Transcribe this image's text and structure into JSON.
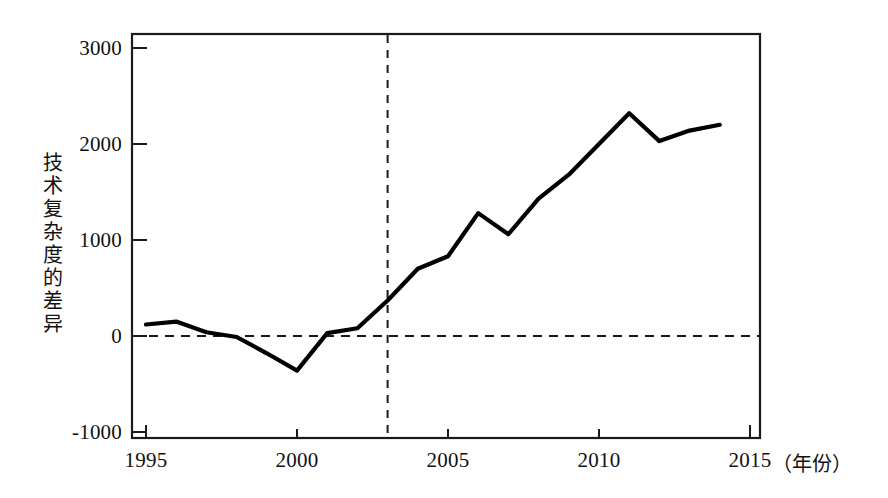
{
  "chart_data": {
    "type": "line",
    "title": "",
    "subtitle": "",
    "xlabel": "年份",
    "ylabel": "技术复杂度的差异",
    "xlim": [
      1995,
      2015
    ],
    "ylim": [
      -1000,
      3000
    ],
    "xticks": [
      "1995",
      "2000",
      "2005",
      "2010",
      "2015"
    ],
    "xtick_values": [
      1995,
      2000,
      2005,
      2010,
      2015
    ],
    "yticks": [
      "3000",
      "2000",
      "1000",
      "0",
      "-1000"
    ],
    "ytick_values": [
      3000,
      2000,
      1000,
      0,
      -1000
    ],
    "grid": false,
    "legend": "none",
    "x": [
      1995,
      1996,
      1997,
      1998,
      1999,
      2000,
      2001,
      2002,
      2003,
      2004,
      2005,
      2006,
      2007,
      2008,
      2009,
      2010,
      2011,
      2012,
      2013,
      2014
    ],
    "series": [
      {
        "name": "技术复杂度的差异",
        "color": "#000000",
        "values": [
          120,
          150,
          40,
          -10,
          -180,
          -360,
          30,
          80,
          370,
          700,
          830,
          1280,
          1060,
          1430,
          1680,
          2000,
          2320,
          2030,
          2140,
          2200
        ]
      }
    ],
    "annotations": [
      {
        "name": "reference-line-vertical",
        "type": "vline",
        "x": 2003,
        "style": "dashed",
        "label": ""
      },
      {
        "name": "reference-line-zero",
        "type": "hline",
        "y": 0,
        "style": "dashed",
        "label": ""
      }
    ]
  },
  "axis": {
    "y_title_chars": [
      "技",
      "术",
      "复",
      "杂",
      "度",
      "的",
      "差",
      "异"
    ],
    "x_unit_label": "（年份）"
  },
  "ticks": {
    "y": [
      {
        "label": "3000"
      },
      {
        "label": "2000"
      },
      {
        "label": "1000"
      },
      {
        "label": "0"
      },
      {
        "label": "-1000"
      }
    ],
    "x": [
      {
        "label": "1995"
      },
      {
        "label": "2000"
      },
      {
        "label": "2005"
      },
      {
        "label": "2010"
      },
      {
        "label": "2015"
      }
    ]
  },
  "colors": {
    "line": "#000000",
    "axis": "#1a1a1a",
    "background": "#ffffff",
    "dashed": "#1a1a1a"
  }
}
